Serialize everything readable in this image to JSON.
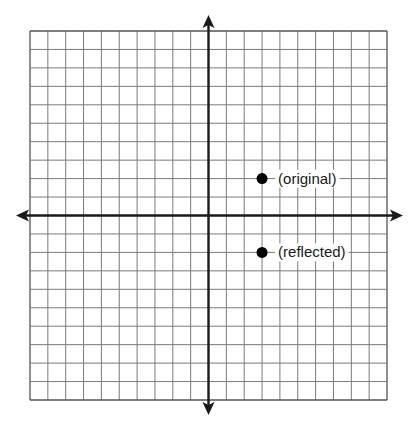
{
  "diagram": {
    "type": "coordinate-plane",
    "grid": {
      "columns": 20,
      "rows": 20,
      "left": 30,
      "top": 31,
      "right": 387,
      "bottom": 400,
      "line_color": "#7a7a7a",
      "border_color": "#555555"
    },
    "axes": {
      "color": "#1a1a1a",
      "x_axis_row": 10,
      "y_axis_col": 10,
      "x_arrow_left": 16,
      "x_arrow_right": 403,
      "y_arrow_top": 15,
      "y_arrow_bottom": 415
    },
    "points": [
      {
        "name": "original",
        "label": "(original)",
        "x": 3,
        "y": 2,
        "color": "#000000"
      },
      {
        "name": "reflected",
        "label": "(reflected)",
        "x": 3,
        "y": -2,
        "color": "#000000"
      }
    ]
  }
}
